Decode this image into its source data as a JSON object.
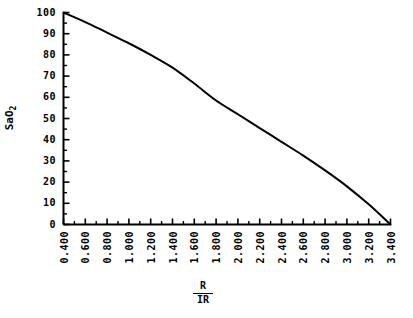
{
  "chart_data": {
    "type": "line",
    "title": "",
    "xlabel": "R/IR",
    "xlabel_numerator": "R",
    "xlabel_denominator": "IR",
    "ylabel": "SaO2",
    "ylabel_base": "SaO",
    "ylabel_subscript": "2",
    "xlim": [
      0.4,
      3.4
    ],
    "ylim": [
      0,
      100
    ],
    "grid": false,
    "legend": false,
    "line_color": "#000000",
    "background_color": "#ffffff",
    "x_tick_labels": [
      "0.400",
      "0.600",
      "0.800",
      "1.000",
      "1.200",
      "1.400",
      "1.600",
      "1.800",
      "2.000",
      "2.200",
      "2.400",
      "2.600",
      "2.800",
      "3.000",
      "3.200",
      "3.400"
    ],
    "x_tick_values": [
      0.4,
      0.6,
      0.8,
      1.0,
      1.2,
      1.4,
      1.6,
      1.8,
      2.0,
      2.2,
      2.4,
      2.6,
      2.8,
      3.0,
      3.2,
      3.4
    ],
    "y_tick_labels": [
      "0",
      "10",
      "20",
      "30",
      "40",
      "50",
      "60",
      "70",
      "80",
      "90",
      "100"
    ],
    "y_tick_values": [
      0,
      10,
      20,
      30,
      40,
      50,
      60,
      70,
      80,
      90,
      100
    ],
    "x_minor_ticks_between": 1,
    "y_minor_ticks_between": 1,
    "series": [
      {
        "name": "SaO2 calibration curve",
        "x": [
          0.4,
          0.6,
          0.8,
          1.0,
          1.2,
          1.4,
          1.6,
          1.8,
          2.0,
          2.2,
          2.4,
          2.6,
          2.8,
          3.0,
          3.2,
          3.4
        ],
        "y": [
          100.0,
          95.5,
          90.5,
          85.5,
          80.0,
          74.0,
          66.5,
          58.5,
          52.0,
          45.5,
          39.0,
          32.5,
          25.5,
          18.0,
          9.5,
          0.0
        ]
      }
    ]
  }
}
